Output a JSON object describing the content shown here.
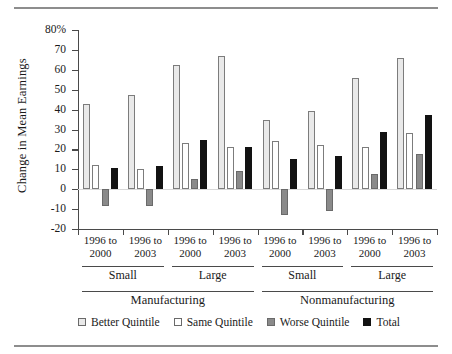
{
  "chart_data": {
    "type": "bar",
    "title": "",
    "xlabel": "",
    "ylabel": "Change in Mean Earnings",
    "ylim": [
      -20,
      80
    ],
    "yticks": [
      "80%",
      "70",
      "60",
      "50",
      "40",
      "30",
      "20",
      "10",
      "0",
      "-10",
      "-20"
    ],
    "ytick_values": [
      80,
      70,
      60,
      50,
      40,
      30,
      20,
      10,
      0,
      -10,
      -20
    ],
    "grid": false,
    "legend_position": "bottom",
    "categories": [
      "1996 to 2000",
      "1996 to 2003",
      "1996 to 2000",
      "1996 to 2003",
      "1996 to 2000",
      "1996 to 2003",
      "1996 to 2000",
      "1996 to 2003"
    ],
    "group_labels": [
      "Small",
      "Large",
      "Small",
      "Large"
    ],
    "section_labels": [
      "Manufacturing",
      "Nonmanufacturing"
    ],
    "series": [
      {
        "name": "Better Quintile",
        "color": "#e9e9e9",
        "values": [
          43,
          47.5,
          62.5,
          67,
          35,
          39.5,
          56,
          66
        ]
      },
      {
        "name": "Same Quintile",
        "color": "#ffffff",
        "values": [
          12,
          10,
          23,
          21,
          24,
          22,
          21,
          28
        ]
      },
      {
        "name": "Worse Quintile",
        "color": "#8a8a8a",
        "values": [
          -8.5,
          -8.5,
          5,
          9,
          -13,
          -11,
          7.5,
          17.5
        ]
      },
      {
        "name": "Total",
        "color": "#121212",
        "values": [
          10.5,
          11.5,
          24.5,
          21,
          15,
          16.5,
          28.5,
          37.5
        ]
      }
    ]
  },
  "legend": {
    "items": [
      {
        "label": "Better Quintile",
        "swatch": "better-quintile-swatch"
      },
      {
        "label": "Same Quintile",
        "swatch": "same-quintile-swatch"
      },
      {
        "label": "Worse Quintile",
        "swatch": "worse-quintile-swatch"
      },
      {
        "label": "Total",
        "swatch": "total-swatch"
      }
    ]
  }
}
